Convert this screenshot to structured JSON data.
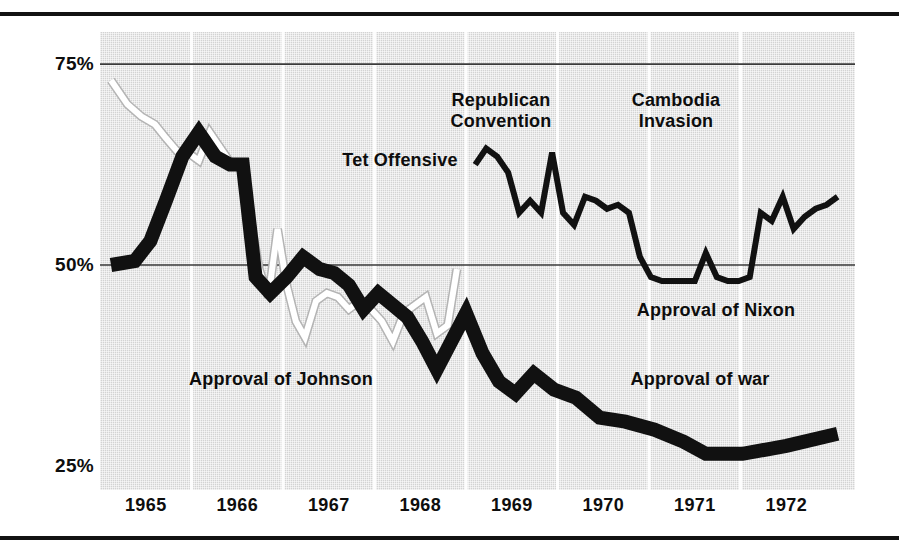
{
  "figure": {
    "name": "approval-trends-chart",
    "background_color": "#ffffff",
    "plot_fill_color": "#d3d3d3",
    "ink_color": "#111111",
    "highlight_color": "#ffffff"
  },
  "chart_data": {
    "type": "line",
    "title": "",
    "subtitle": "",
    "xlabel": "",
    "ylabel": "",
    "xlim": [
      1964.5,
      1972.75
    ],
    "ylim": [
      22.0,
      79.0
    ],
    "grid": true,
    "grid_horizontal_values": [
      75,
      50
    ],
    "grid_vertical_values": [
      1965.5,
      1966.5,
      1967.5,
      1968.5,
      1969.5,
      1970.5,
      1971.5
    ],
    "legend_position": "inline-annotations",
    "ytick_labels": [
      "75%",
      "50%",
      "25%"
    ],
    "ytick_values": [
      75,
      50,
      25
    ],
    "xtick_labels": [
      "1965",
      "1966",
      "1967",
      "1968",
      "1969",
      "1970",
      "1971",
      "1972"
    ],
    "xtick_values": [
      1965,
      1966,
      1967,
      1968,
      1969,
      1970,
      1971,
      1972
    ],
    "series": [
      {
        "name": "Approval of Johnson",
        "style": "white-thin-line",
        "color": "#ffffff",
        "x": [
          1964.62,
          1964.8,
          1964.95,
          1965.1,
          1965.22,
          1965.34,
          1965.46,
          1965.58,
          1965.7,
          1965.82,
          1965.94,
          1966.04,
          1966.14,
          1966.24,
          1966.34,
          1966.44,
          1966.54,
          1966.64,
          1966.74,
          1966.86,
          1966.98,
          1967.1,
          1967.22,
          1967.34,
          1967.46,
          1967.58,
          1967.7,
          1967.82,
          1967.94,
          1968.06,
          1968.18,
          1968.3,
          1968.4
        ],
        "y": [
          73.0,
          70.0,
          68.5,
          67.5,
          65.8,
          64.2,
          64.0,
          63.0,
          66.5,
          64.5,
          62.5,
          62.6,
          56.0,
          49.5,
          46.0,
          54.5,
          47.5,
          43.0,
          41.0,
          45.5,
          46.5,
          46.0,
          44.5,
          45.5,
          44.5,
          43.0,
          40.5,
          44.0,
          45.0,
          46.0,
          41.5,
          42.5,
          49.5
        ]
      },
      {
        "name": "Approval of Nixon",
        "style": "black-thin-line",
        "color": "#111111",
        "x": [
          1968.6,
          1968.72,
          1968.84,
          1968.96,
          1969.08,
          1969.2,
          1969.32,
          1969.44,
          1969.56,
          1969.68,
          1969.8,
          1969.92,
          1970.04,
          1970.16,
          1970.28,
          1970.4,
          1970.52,
          1970.64,
          1970.76,
          1970.88,
          1971.0,
          1971.12,
          1971.24,
          1971.36,
          1971.48,
          1971.6,
          1971.72,
          1971.84,
          1971.96,
          1972.08,
          1972.2,
          1972.32,
          1972.44,
          1972.56
        ],
        "y": [
          62.5,
          64.5,
          63.5,
          61.5,
          56.5,
          58.0,
          56.5,
          64.0,
          56.5,
          55.0,
          58.5,
          58.0,
          57.0,
          57.5,
          56.5,
          51.0,
          48.5,
          48.0,
          48.0,
          48.0,
          48.0,
          51.5,
          48.5,
          48.0,
          48.0,
          48.5,
          56.5,
          55.5,
          58.5,
          54.5,
          56.0,
          57.0,
          57.5,
          58.5
        ]
      },
      {
        "name": "Approval of war",
        "style": "black-thick-line",
        "color": "#111111",
        "x": [
          1964.62,
          1964.88,
          1965.05,
          1965.22,
          1965.4,
          1965.58,
          1965.76,
          1965.92,
          1966.06,
          1966.2,
          1966.36,
          1966.54,
          1966.72,
          1966.9,
          1967.06,
          1967.22,
          1967.38,
          1967.54,
          1967.7,
          1967.86,
          1968.02,
          1968.18,
          1968.34,
          1968.5,
          1968.68,
          1968.86,
          1969.04,
          1969.24,
          1969.46,
          1969.7,
          1969.96,
          1970.24,
          1970.56,
          1970.88,
          1971.12,
          1971.52,
          1972.0,
          1972.56
        ],
        "y": [
          50.0,
          50.5,
          53.0,
          58.0,
          63.5,
          66.5,
          63.5,
          62.5,
          62.5,
          48.5,
          46.5,
          48.5,
          51.0,
          49.5,
          49.0,
          47.5,
          44.5,
          46.5,
          45.0,
          43.5,
          40.5,
          37.0,
          40.5,
          44.0,
          39.0,
          35.5,
          34.0,
          36.5,
          34.5,
          33.5,
          31.0,
          30.5,
          29.5,
          28.0,
          26.5,
          26.5,
          27.5,
          29.0
        ]
      }
    ],
    "annotations": [
      {
        "text": "Republican\nConvention",
        "x_px": 501,
        "y_px": 90,
        "align": "center",
        "name": "annotation-republican-convention"
      },
      {
        "text": "Cambodia\nInvasion",
        "x_px": 676,
        "y_px": 90,
        "align": "center",
        "name": "annotation-cambodia-invasion"
      },
      {
        "text": "Tet Offensive",
        "x_px": 400,
        "y_px": 150,
        "align": "center",
        "name": "annotation-tet-offensive"
      },
      {
        "text": "Approval of Nixon",
        "x_px": 716,
        "y_px": 300,
        "align": "center",
        "name": "annotation-approval-of-nixon"
      },
      {
        "text": "Approval of Johnson",
        "x_px": 281,
        "y_px": 369,
        "align": "center",
        "name": "annotation-approval-of-johnson"
      },
      {
        "text": "Approval of war",
        "x_px": 700,
        "y_px": 369,
        "align": "center",
        "name": "annotation-approval-of-war"
      }
    ]
  }
}
